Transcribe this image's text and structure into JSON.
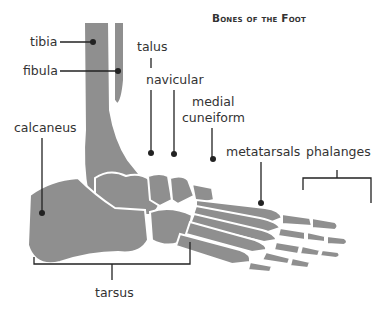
{
  "title": "Bones of the Foot",
  "colors": {
    "bone": "#8f8f8f",
    "line": "#222222",
    "text": "#333333",
    "background": "#ffffff"
  },
  "labels": {
    "tibia": "tibia",
    "fibula": "fibula",
    "talus": "talus",
    "navicular": "navicular",
    "medial_cuneiform": "medial",
    "medial_cuneiform_2": "cuneiform",
    "calcaneus": "calcaneus",
    "metatarsals": "metatarsals",
    "phalanges": "phalanges",
    "tarsus": "tarsus"
  }
}
